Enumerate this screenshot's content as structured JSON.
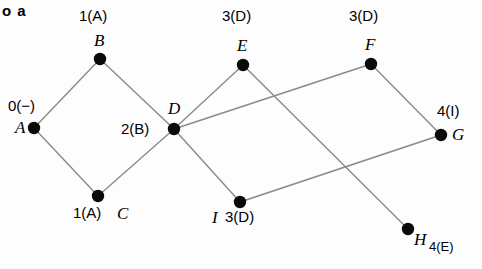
{
  "figure": {
    "caption": "o a",
    "width": 482,
    "height": 269,
    "background_color": "#fdfdfd",
    "edge_color": "#8a8a8a",
    "node_color": "#0a0a0a"
  },
  "chart_data": {
    "type": "diagram",
    "subtype": "shortest-path-tree-graph",
    "title": "o a",
    "nodes": [
      {
        "id": "A",
        "label": "A",
        "distance": "0",
        "parent": "−",
        "dist_label": "0(−)",
        "x": 34,
        "y": 128
      },
      {
        "id": "B",
        "label": "B",
        "distance": "1",
        "parent": "A",
        "dist_label": "1(A)",
        "x": 100,
        "y": 59
      },
      {
        "id": "C",
        "label": "C",
        "distance": "1",
        "parent": "A",
        "dist_label": "1(A)",
        "x": 98,
        "y": 196
      },
      {
        "id": "D",
        "label": "D",
        "distance": "2",
        "parent": "B",
        "dist_label": "2(B)",
        "x": 174,
        "y": 129
      },
      {
        "id": "E",
        "label": "E",
        "distance": "3",
        "parent": "D",
        "dist_label": "3(D)",
        "x": 243,
        "y": 65
      },
      {
        "id": "F",
        "label": "F",
        "distance": "3",
        "parent": "D",
        "dist_label": "3(D)",
        "x": 371,
        "y": 64
      },
      {
        "id": "G",
        "label": "G",
        "distance": "4",
        "parent": "I",
        "dist_label": "4(I)",
        "x": 441,
        "y": 135
      },
      {
        "id": "H",
        "label": "H",
        "distance": "4",
        "parent": "E",
        "dist_label": "4(E)",
        "x": 408,
        "y": 229
      },
      {
        "id": "I",
        "label": "I",
        "distance": "3",
        "parent": "D",
        "dist_label": "3(D)",
        "x": 240,
        "y": 202
      }
    ],
    "edges": [
      {
        "from": "A",
        "to": "B"
      },
      {
        "from": "A",
        "to": "C"
      },
      {
        "from": "B",
        "to": "D"
      },
      {
        "from": "C",
        "to": "D"
      },
      {
        "from": "D",
        "to": "E"
      },
      {
        "from": "D",
        "to": "F"
      },
      {
        "from": "D",
        "to": "I"
      },
      {
        "from": "E",
        "to": "H"
      },
      {
        "from": "I",
        "to": "G"
      },
      {
        "from": "F",
        "to": "G"
      }
    ]
  },
  "labels": {
    "name_A": "A",
    "name_B": "B",
    "name_C": "C",
    "name_D": "D",
    "name_E": "E",
    "name_F": "F",
    "name_G": "G",
    "name_H": "H",
    "name_I": "I",
    "dist_A": "0(−)",
    "dist_B": "1(A)",
    "dist_C": "1(A)",
    "dist_D": "2(B)",
    "dist_E": "3(D)",
    "dist_F": "3(D)",
    "dist_G": "4(I)",
    "dist_H": "4(E)",
    "dist_I": "3(D)"
  }
}
